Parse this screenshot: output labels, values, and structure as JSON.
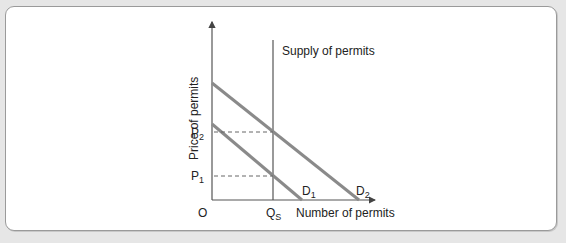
{
  "diagram": {
    "y_axis_label": "Price of permits",
    "x_axis_label": "Number of permits",
    "origin_label": "O",
    "supply_label": "Supply of permits",
    "qs_label": "Q",
    "qs_sub": "S",
    "p1_label": "P",
    "p1_sub": "1",
    "p2_label": "P",
    "p2_sub": "2",
    "d1_label": "D",
    "d1_sub": "1",
    "d2_label": "D",
    "d2_sub": "2",
    "colors": {
      "axis": "#555555",
      "demand": "#8a8a8a",
      "dashed": "#666666",
      "panel_border": "#9a9a9a",
      "background": "#e6e6e6"
    }
  }
}
